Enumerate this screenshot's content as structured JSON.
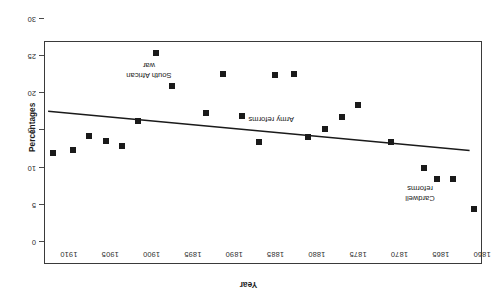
{
  "chart_data": {
    "type": "scatter",
    "title": "",
    "xlabel": "Year",
    "ylabel": "Percentages",
    "xlim": [
      1860,
      1913
    ],
    "ylim": [
      0,
      30
    ],
    "y_inverted": true,
    "grid": false,
    "legend": null,
    "orientation_note": "figure rendered rotated 180 degrees",
    "xticks": [
      1860,
      1865,
      1870,
      1875,
      1880,
      1885,
      1890,
      1895,
      1900,
      1905,
      1910
    ],
    "xtick_labels": [
      "1860",
      "1865",
      "1870",
      "1875",
      "1880",
      "1885",
      "1890",
      "1895",
      "1900",
      "1905",
      "1910"
    ],
    "yticks": [
      0,
      5,
      10,
      15,
      20,
      25,
      30
    ],
    "ytick_labels": [
      "0",
      "5",
      "10",
      "15",
      "20",
      "25",
      "30"
    ],
    "points": [
      {
        "x": 1861.0,
        "y": 4.4
      },
      {
        "x": 1863.5,
        "y": 8.5
      },
      {
        "x": 1865.5,
        "y": 8.5
      },
      {
        "x": 1867.0,
        "y": 10.0
      },
      {
        "x": 1871.0,
        "y": 13.4
      },
      {
        "x": 1875.0,
        "y": 18.4
      },
      {
        "x": 1877.0,
        "y": 16.8
      },
      {
        "x": 1879.0,
        "y": 15.2
      },
      {
        "x": 1881.0,
        "y": 14.1
      },
      {
        "x": 1882.8,
        "y": 22.6
      },
      {
        "x": 1885.0,
        "y": 22.5
      },
      {
        "x": 1887.0,
        "y": 13.4
      },
      {
        "x": 1889.0,
        "y": 16.9
      },
      {
        "x": 1891.3,
        "y": 22.6
      },
      {
        "x": 1893.4,
        "y": 17.3
      },
      {
        "x": 1897.5,
        "y": 21.0
      },
      {
        "x": 1899.5,
        "y": 25.4
      },
      {
        "x": 1901.6,
        "y": 16.3
      },
      {
        "x": 1903.6,
        "y": 12.9
      },
      {
        "x": 1905.5,
        "y": 13.6
      },
      {
        "x": 1907.6,
        "y": 14.3
      },
      {
        "x": 1909.5,
        "y": 12.4
      },
      {
        "x": 1911.9,
        "y": 12.0
      }
    ],
    "trendline": {
      "name": "linear trend",
      "x_start": 1861.5,
      "y_start": 12.3,
      "x_end": 1912.5,
      "y_end": 17.6
    },
    "annotations": [
      {
        "label": "Cardwell\nreforms",
        "x": 1867.5,
        "y": 6.6
      },
      {
        "label": "Army reforms",
        "x": 1885.5,
        "y": 16.6
      },
      {
        "label": "South African\nwar",
        "x": 1900.3,
        "y": 23.1
      }
    ]
  }
}
